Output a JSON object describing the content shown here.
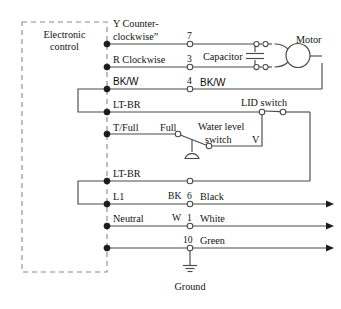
{
  "diagram": {
    "ground_caption": "Ground",
    "control_box": {
      "line1": "Electronic",
      "line2": "control"
    },
    "colors": {
      "wire": "#4a4a4a",
      "node_fill": "#1c1c1c",
      "dashed_box": "#8a8a8a",
      "text": "#121212",
      "background": "#ffffff"
    },
    "terminal_rows": [
      {
        "id": "row-y-counterclockwise",
        "label_line1": "Y Counter-",
        "label_line2": "clockwise”",
        "terminal_number": "7",
        "right_label": ""
      },
      {
        "id": "row-r-clockwise",
        "label_line1": "R Clockwise",
        "label_line2": "",
        "terminal_number": "3",
        "right_label": ""
      },
      {
        "id": "row-bk-w",
        "label_line1": "BK/W",
        "label_line2": "",
        "terminal_number": "4",
        "right_label": "BK/W"
      },
      {
        "id": "row-lt-br-upper",
        "label_line1": "LT-BR",
        "label_line2": "",
        "terminal_number": "",
        "right_label": ""
      },
      {
        "id": "row-t-full",
        "label_line1": "T/Full",
        "label_line2": "",
        "terminal_number": "",
        "right_label": "Full"
      },
      {
        "id": "row-lt-br-lower",
        "label_line1": "LT-BR",
        "label_line2": "",
        "terminal_number": "",
        "right_label": ""
      },
      {
        "id": "row-l1",
        "label_line1": "L1",
        "label_line2": "",
        "terminal_number": "6",
        "right_label": "Black",
        "wire_code": "BK"
      },
      {
        "id": "row-neutral",
        "label_line1": "Neutral",
        "label_line2": "",
        "terminal_number": "1",
        "right_label": "White",
        "wire_code": "W"
      },
      {
        "id": "row-green",
        "label_line1": "",
        "label_line2": "",
        "terminal_number": "10",
        "right_label": "Green",
        "wire_code": ""
      }
    ],
    "components": {
      "motor": "Motor",
      "capacitor": "Capacitor",
      "lid_switch": "LID switch",
      "water_level_switch_line1": "Water level",
      "water_level_switch_line2": "switch",
      "water_level_contact_full": "Full",
      "water_level_contact_v": "V"
    }
  }
}
